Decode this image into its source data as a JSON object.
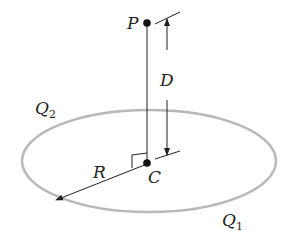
{
  "diagram": {
    "labels": {
      "P": "P",
      "C": "C",
      "D": "D",
      "R": "R",
      "Q2_main": "Q",
      "Q2_sub": "2",
      "Q1_main": "Q",
      "Q1_sub": "1"
    },
    "colors": {
      "ring": "#b8b8b8",
      "lines": "#222222"
    }
  }
}
